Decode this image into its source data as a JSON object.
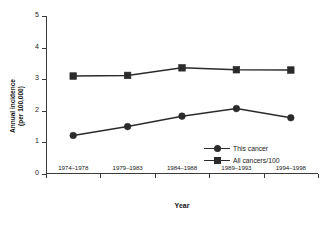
{
  "chart_data": {
    "type": "line",
    "title": "",
    "xlabel": "Year",
    "ylabel": "Annual incidence\n(per 100,000)",
    "ylabel_line1": "Annual incidence",
    "ylabel_line2": "(per 100,000)",
    "categories": [
      "1974–1978",
      "1979–1983",
      "1984–1988",
      "1989–1993",
      "1994–1998"
    ],
    "ylim": [
      0,
      5
    ],
    "yticks": [
      0,
      1,
      2,
      3,
      4,
      5
    ],
    "ytick_labels": [
      "0",
      "1",
      "2",
      "3",
      "4",
      "5"
    ],
    "grid": false,
    "legend_position": "inside-bottom-right",
    "series": [
      {
        "name": "This cancer",
        "marker": "circle",
        "color": "#2b2b2b",
        "values": [
          1.22,
          1.5,
          1.83,
          2.07,
          1.78
        ]
      },
      {
        "name": "All cancers/100",
        "marker": "square",
        "color": "#2b2b2b",
        "values": [
          3.1,
          3.12,
          3.36,
          3.3,
          3.29
        ]
      }
    ]
  },
  "figure": {
    "cropped_title_text": ""
  }
}
